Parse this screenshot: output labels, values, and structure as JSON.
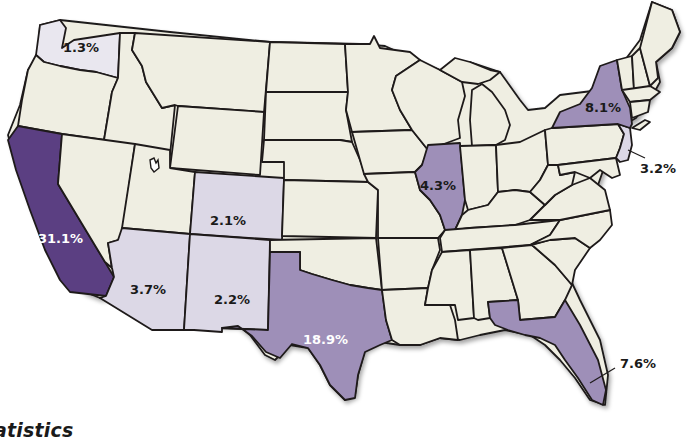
{
  "map": {
    "type": "choropleth",
    "region": "United States",
    "colors": {
      "base": "#efeee2",
      "low": "#dcd8e6",
      "mid": "#9e8fb8",
      "high": "#5b3f82",
      "border": "#1e1a1a",
      "water": "#ffffff"
    },
    "labels": [
      {
        "state": "Washington",
        "value": "1.3%",
        "text_color": "#1a1a1a"
      },
      {
        "state": "California",
        "value": "31.1%",
        "text_color": "#ffffff"
      },
      {
        "state": "Arizona",
        "value": "3.7%",
        "text_color": "#1a1a1a"
      },
      {
        "state": "Colorado",
        "value": "2.1%",
        "text_color": "#1a1a1a"
      },
      {
        "state": "New Mexico",
        "value": "2.2%",
        "text_color": "#1a1a1a"
      },
      {
        "state": "Texas",
        "value": "18.9%",
        "text_color": "#ffffff"
      },
      {
        "state": "Illinois",
        "value": "4.3%",
        "text_color": "#1a1a1a"
      },
      {
        "state": "New York",
        "value": "8.1%",
        "text_color": "#1a1a1a"
      },
      {
        "state": "New Jersey",
        "value": "3.2%",
        "text_color": "#1a1a1a"
      },
      {
        "state": "Florida",
        "value": "7.6%",
        "text_color": "#1a1a1a"
      }
    ]
  },
  "footer": {
    "title_fragment": "atistics"
  }
}
